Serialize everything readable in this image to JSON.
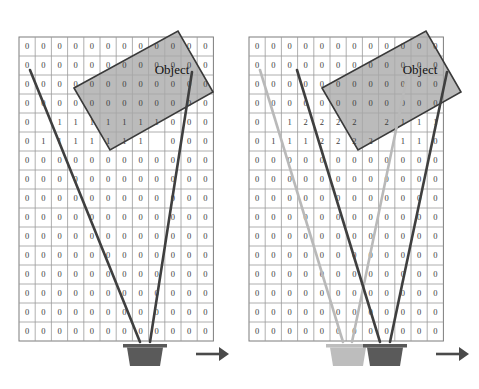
{
  "figure": {
    "title": "",
    "panels": [
      {
        "id": "left",
        "name": "single-sensor-occupancy-grid",
        "object_label": "Object",
        "direction_arrow": "right-arrow",
        "grid": {
          "rows": 16,
          "cols": 12,
          "x0": 19,
          "y0": 37,
          "cell_w": 16.2,
          "cell_h": 19.0,
          "values": [
            [
              "0",
              "0",
              "0",
              "0",
              "0",
              "0",
              "0",
              "0",
              "0",
              "0",
              "0",
              "0"
            ],
            [
              "0",
              "0",
              "0",
              "0",
              "0",
              "0",
              "0",
              "0",
              "0",
              "0",
              "0",
              "0"
            ],
            [
              "0",
              "0",
              "0",
              "0",
              "0",
              "0",
              "0",
              "0",
              "0",
              "0",
              "0",
              "0"
            ],
            [
              "0",
              "0",
              "0",
              "0",
              "0",
              "0",
              "0",
              "0",
              "0",
              "0",
              "0",
              "0"
            ],
            [
              "0",
              "",
              "1",
              "1",
              "1",
              "1",
              "1",
              "1",
              "1",
              "0",
              "0",
              "0"
            ],
            [
              "0",
              "1",
              "1",
              "1",
              "1",
              "1",
              "1",
              "1",
              "",
              "0",
              "0",
              "0"
            ],
            [
              "0",
              "0",
              "0",
              "0",
              "0",
              "0",
              "0",
              "0",
              "0",
              "0",
              "0",
              "0"
            ],
            [
              "0",
              "0",
              "0",
              "0",
              "0",
              "0",
              "0",
              "0",
              "0",
              "0",
              "0",
              "0"
            ],
            [
              "0",
              "0",
              "0",
              "0",
              "0",
              "0",
              "0",
              "0",
              "0",
              "0",
              "0",
              "0"
            ],
            [
              "0",
              "0",
              "0",
              "0",
              "0",
              "0",
              "0",
              "0",
              "0",
              "0",
              "0",
              "0"
            ],
            [
              "0",
              "0",
              "0",
              "0",
              "0",
              "0",
              "0",
              "0",
              "0",
              "0",
              "0",
              "0"
            ],
            [
              "0",
              "0",
              "0",
              "0",
              "0",
              "0",
              "0",
              "0",
              "0",
              "0",
              "0",
              "0"
            ],
            [
              "0",
              "0",
              "0",
              "0",
              "0",
              "0",
              "0",
              "0",
              "0",
              "0",
              "0",
              "0"
            ],
            [
              "0",
              "0",
              "0",
              "0",
              "0",
              "0",
              "0",
              "0",
              "0",
              "0",
              "0",
              "0"
            ],
            [
              "0",
              "0",
              "0",
              "0",
              "0",
              "0",
              "0",
              "0",
              "0",
              "0",
              "0",
              "0"
            ],
            [
              "0",
              "0",
              "0",
              "0",
              "0",
              "0",
              "0",
              "0",
              "0",
              "0",
              "0",
              "0"
            ]
          ]
        },
        "object_rect": {
          "points": "74,88 178,31 213,92 110,150",
          "label_x": 172,
          "label_y": 74
        },
        "beams": [
          {
            "name": "beam-left-dark",
            "color": "#3f3f3f",
            "x1": 30,
            "y1": 70,
            "x2": 140,
            "y2": 342
          },
          {
            "name": "beam-right-dark",
            "color": "#3f3f3f",
            "x1": 192,
            "y1": 72,
            "x2": 150,
            "y2": 342
          }
        ],
        "sensors": [
          {
            "name": "sensor-dark",
            "x": 145,
            "y": 344,
            "color": "#5a5a5a"
          }
        ],
        "arrow": {
          "x1": 196,
          "y1": 354,
          "x2": 229,
          "y2": 354,
          "color": "#4a4a4a"
        }
      },
      {
        "id": "right",
        "name": "dual-sensor-occupancy-grid",
        "object_label": "Object",
        "direction_arrow": "right-arrow",
        "grid": {
          "rows": 16,
          "cols": 12,
          "x0": 9,
          "y0": 37,
          "cell_w": 16.2,
          "cell_h": 19.0,
          "values": [
            [
              "0",
              "0",
              "0",
              "0",
              "0",
              "0",
              "0",
              "0",
              "0",
              "0",
              "0",
              "0"
            ],
            [
              "0",
              "0",
              "0",
              "0",
              "0",
              "0",
              "0",
              "0",
              "0",
              "0",
              "0",
              "0"
            ],
            [
              "0",
              "0",
              "0",
              "0",
              "0",
              "0",
              "0",
              "0",
              "0",
              "0",
              "0",
              "0"
            ],
            [
              "0",
              "0",
              "0",
              "0",
              "0",
              "0",
              "0",
              "0",
              "0",
              "0",
              "0",
              "0"
            ],
            [
              "0",
              "",
              "1",
              "2",
              "2",
              "2",
              "2",
              "",
              "2",
              "1",
              "1",
              "1"
            ],
            [
              "0",
              "1",
              "1",
              "1",
              "2",
              "2",
              "2",
              "2",
              "",
              "1",
              "1",
              "0"
            ],
            [
              "0",
              "0",
              "0",
              "0",
              "0",
              "0",
              "0",
              "0",
              "0",
              "0",
              "0",
              "0"
            ],
            [
              "0",
              "0",
              "0",
              "0",
              "0",
              "0",
              "0",
              "0",
              "0",
              "0",
              "0",
              "0"
            ],
            [
              "0",
              "0",
              "0",
              "0",
              "0",
              "0",
              "0",
              "0",
              "0",
              "0",
              "0",
              "0"
            ],
            [
              "0",
              "0",
              "0",
              "0",
              "0",
              "0",
              "0",
              "0",
              "0",
              "0",
              "0",
              "0"
            ],
            [
              "0",
              "0",
              "0",
              "0",
              "0",
              "0",
              "0",
              "0",
              "0",
              "0",
              "0",
              "0"
            ],
            [
              "0",
              "0",
              "0",
              "0",
              "0",
              "0",
              "0",
              "0",
              "0",
              "0",
              "0",
              "0"
            ],
            [
              "0",
              "0",
              "0",
              "0",
              "0",
              "0",
              "0",
              "0",
              "0",
              "0",
              "0",
              "0"
            ],
            [
              "0",
              "0",
              "0",
              "0",
              "0",
              "0",
              "0",
              "0",
              "0",
              "0",
              "0",
              "0"
            ],
            [
              "0",
              "0",
              "0",
              "0",
              "0",
              "0",
              "0",
              "0",
              "0",
              "0",
              "0",
              "0"
            ],
            [
              "0",
              "0",
              "0",
              "0",
              "0",
              "0",
              "0",
              "0",
              "0",
              "0",
              "0",
              "0"
            ]
          ]
        },
        "object_rect": {
          "points": "82,88 186,31 221,92 118,150",
          "label_x": 180,
          "label_y": 74
        },
        "beams": [
          {
            "name": "beam-left-light",
            "color": "#b9b9b9",
            "x1": 20,
            "y1": 70,
            "x2": 103,
            "y2": 342
          },
          {
            "name": "beam-right-light",
            "color": "#b9b9b9",
            "x1": 168,
            "y1": 72,
            "x2": 112,
            "y2": 342
          },
          {
            "name": "beam-left-dark",
            "color": "#3f3f3f",
            "x1": 57,
            "y1": 70,
            "x2": 140,
            "y2": 342
          },
          {
            "name": "beam-right-dark",
            "color": "#3f3f3f",
            "x1": 207,
            "y1": 72,
            "x2": 150,
            "y2": 342
          }
        ],
        "sensors": [
          {
            "name": "sensor-light",
            "x": 108,
            "y": 344,
            "color": "#bdbdbd"
          },
          {
            "name": "sensor-dark",
            "x": 145,
            "y": 344,
            "color": "#5a5a5a"
          }
        ],
        "arrow": {
          "x1": 196,
          "y1": 354,
          "x2": 229,
          "y2": 354,
          "color": "#4a4a4a"
        }
      }
    ],
    "colors": {
      "grid_line": "#9a9a9a",
      "grid_border": "#7d7d7d",
      "object_fill": "#a8a8a8",
      "object_stroke": "#3a3a3a",
      "beam_dark": "#3f3f3f",
      "beam_light": "#b9b9b9",
      "sensor_dark": "#5a5a5a",
      "sensor_light": "#bdbdbd",
      "text": "#3c3c3c",
      "background": "#ffffff"
    }
  },
  "chart_data": {
    "type": "heatmap",
    "xlabel": "",
    "ylabel": "",
    "grid": true,
    "legend_position": "none",
    "annotations": [
      "Object",
      "Object"
    ],
    "panels": [
      {
        "name": "left-single-sensor",
        "rows": 16,
        "cols": 12,
        "nonzero_cells": [
          {
            "row": 4,
            "cols": [
              2,
              3,
              4,
              5,
              6,
              7,
              8
            ],
            "value": 1
          },
          {
            "row": 5,
            "cols": [
              1,
              2,
              3,
              4,
              5,
              6,
              7
            ],
            "value": 1
          }
        ],
        "default_value": 0,
        "sensor_count": 1
      },
      {
        "name": "right-dual-sensor",
        "rows": 16,
        "cols": 12,
        "nonzero_cells": [
          {
            "row": 4,
            "cols": [
              2
            ],
            "value": 1
          },
          {
            "row": 4,
            "cols": [
              3,
              4,
              5,
              6,
              8
            ],
            "value": 2
          },
          {
            "row": 4,
            "cols": [
              9,
              10,
              11
            ],
            "value": 1
          },
          {
            "row": 5,
            "cols": [
              1,
              2,
              3
            ],
            "value": 1
          },
          {
            "row": 5,
            "cols": [
              4,
              5,
              6,
              7
            ],
            "value": 2
          },
          {
            "row": 5,
            "cols": [
              9,
              10
            ],
            "value": 1
          }
        ],
        "default_value": 0,
        "sensor_count": 2
      }
    ]
  }
}
